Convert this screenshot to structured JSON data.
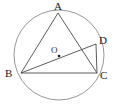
{
  "figure": {
    "background_color": "#ffffff",
    "stroke_color": "#4a4a4a",
    "circle_stroke_color": "#8a8a8a",
    "label_color": "#1a1a1a",
    "width": 115,
    "height": 107,
    "circle": {
      "center_x": 59,
      "center_y": 55,
      "radius": 45,
      "label": "circle-O"
    },
    "center_point": {
      "label": "O",
      "x": 59,
      "y": 56,
      "label_x": 51,
      "label_y": 46
    },
    "points": [
      {
        "label": "A",
        "x": 58,
        "y": 13,
        "label_x": 54,
        "label_y": 1
      },
      {
        "label": "B",
        "x": 21,
        "y": 73,
        "label_x": 5,
        "label_y": 68
      },
      {
        "label": "C",
        "x": 97,
        "y": 73,
        "label_x": 100,
        "label_y": 70
      },
      {
        "label": "D",
        "x": 96,
        "y": 44,
        "label_x": 99,
        "label_y": 35
      }
    ],
    "segments": [
      {
        "name": "AB",
        "from": "A",
        "to": "B",
        "x1": 58,
        "y1": 13,
        "x2": 21,
        "y2": 73
      },
      {
        "name": "BC",
        "from": "B",
        "to": "C",
        "x1": 21,
        "y1": 73,
        "x2": 97,
        "y2": 73
      },
      {
        "name": "AC",
        "from": "A",
        "to": "C",
        "x1": 58,
        "y1": 13,
        "x2": 97,
        "y2": 73
      },
      {
        "name": "BD",
        "from": "B",
        "to": "D",
        "x1": 21,
        "y1": 73,
        "x2": 96,
        "y2": 44
      },
      {
        "name": "DC",
        "from": "D",
        "to": "C",
        "x1": 96,
        "y1": 44,
        "x2": 97,
        "y2": 73
      }
    ]
  }
}
